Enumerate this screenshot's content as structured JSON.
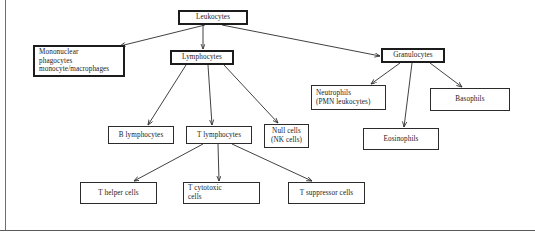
{
  "diagram": {
    "style": {
      "line_color": "#2b2b2b",
      "box_border_color": "#2b2b2b",
      "text_color": "#1a1a1a",
      "background": "#ffffff",
      "frame_color": "#5a5a5a"
    },
    "nodes": [
      {
        "id": "leukocytes",
        "label": "Leukocytes",
        "x": 178,
        "y": 10,
        "w": 70,
        "h": 15,
        "emphasis": "thick",
        "align": "center"
      },
      {
        "id": "mononuclear-phagocytes",
        "label": "Mononuclear\nphagocytes\nmonocyte/macrophages",
        "x": 33,
        "y": 45,
        "w": 92,
        "h": 32,
        "emphasis": "thick",
        "align": "left"
      },
      {
        "id": "lymphocytes",
        "label": "Lymphocytes",
        "x": 170,
        "y": 50,
        "w": 64,
        "h": 15,
        "emphasis": "thick",
        "align": "center"
      },
      {
        "id": "granulocytes",
        "label": "Granulocytes",
        "x": 381,
        "y": 48,
        "w": 64,
        "h": 15,
        "emphasis": "thick",
        "align": "center"
      },
      {
        "id": "neutrophils",
        "label": "Neutrophils\n(PMN leukocytes)",
        "x": 311,
        "y": 85,
        "w": 75,
        "h": 25,
        "emphasis": "normal",
        "align": "left"
      },
      {
        "id": "basophils",
        "label": "Basophils",
        "x": 430,
        "y": 88,
        "w": 80,
        "h": 23,
        "emphasis": "normal",
        "align": "center"
      },
      {
        "id": "eosinophils",
        "label": "Eosinophils",
        "x": 363,
        "y": 128,
        "w": 76,
        "h": 22,
        "emphasis": "normal",
        "align": "center"
      },
      {
        "id": "b-lymphocytes",
        "label": "B lymphocytes",
        "x": 108,
        "y": 126,
        "w": 66,
        "h": 18,
        "emphasis": "normal",
        "align": "center"
      },
      {
        "id": "t-lymphocytes",
        "label": "T lymphocytes",
        "x": 186,
        "y": 126,
        "w": 66,
        "h": 18,
        "emphasis": "normal",
        "align": "center"
      },
      {
        "id": "null-cells",
        "label": "Null cells\n(NK cells)",
        "x": 264,
        "y": 124,
        "w": 45,
        "h": 24,
        "emphasis": "normal",
        "align": "center"
      },
      {
        "id": "t-helper-cells",
        "label": "T helper cells",
        "x": 80,
        "y": 182,
        "w": 77,
        "h": 22,
        "emphasis": "normal",
        "align": "center"
      },
      {
        "id": "t-cytotoxic-cells",
        "label": "T cytotoxic\ncells",
        "x": 183,
        "y": 182,
        "w": 77,
        "h": 22,
        "emphasis": "normal",
        "align": "left"
      },
      {
        "id": "t-suppressor-cells",
        "label": "T suppressor cells",
        "x": 288,
        "y": 182,
        "w": 77,
        "h": 22,
        "emphasis": "normal",
        "align": "center"
      }
    ],
    "edges": [
      {
        "id": "leukocytes-to-mononuclear",
        "from": "leukocytes",
        "to": "mononuclear-phagocytes",
        "x1": 205,
        "y1": 25,
        "x2": 120,
        "y2": 46
      },
      {
        "id": "leukocytes-to-lymphocytes",
        "from": "leukocytes",
        "to": "lymphocytes",
        "x1": 203,
        "y1": 25,
        "x2": 203,
        "y2": 49
      },
      {
        "id": "leukocytes-to-granulocytes",
        "from": "leukocytes",
        "to": "granulocytes",
        "x1": 222,
        "y1": 25,
        "x2": 380,
        "y2": 56
      },
      {
        "id": "lymphocytes-to-b-lymphocytes",
        "from": "lymphocytes",
        "to": "b-lymphocytes",
        "x1": 186,
        "y1": 65,
        "x2": 148,
        "y2": 125
      },
      {
        "id": "lymphocytes-to-t-lymphocytes",
        "from": "lymphocytes",
        "to": "t-lymphocytes",
        "x1": 208,
        "y1": 65,
        "x2": 212,
        "y2": 125
      },
      {
        "id": "lymphocytes-to-null-cells",
        "from": "lymphocytes",
        "to": "null-cells",
        "x1": 224,
        "y1": 65,
        "x2": 278,
        "y2": 123
      },
      {
        "id": "granulocytes-to-neutrophils",
        "from": "granulocytes",
        "to": "neutrophils",
        "x1": 400,
        "y1": 63,
        "x2": 371,
        "y2": 84
      },
      {
        "id": "granulocytes-to-eosinophils",
        "from": "granulocytes",
        "to": "eosinophils",
        "x1": 412,
        "y1": 63,
        "x2": 404,
        "y2": 127
      },
      {
        "id": "granulocytes-to-basophils",
        "from": "granulocytes",
        "to": "basophils",
        "x1": 430,
        "y1": 63,
        "x2": 462,
        "y2": 87
      },
      {
        "id": "t-lymphocytes-to-t-helper",
        "from": "t-lymphocytes",
        "to": "t-helper-cells",
        "x1": 203,
        "y1": 144,
        "x2": 134,
        "y2": 181
      },
      {
        "id": "t-lymphocytes-to-t-cytotoxic",
        "from": "t-lymphocytes",
        "to": "t-cytotoxic-cells",
        "x1": 218,
        "y1": 144,
        "x2": 219,
        "y2": 181
      },
      {
        "id": "t-lymphocytes-to-t-suppressor",
        "from": "t-lymphocytes",
        "to": "t-suppressor-cells",
        "x1": 232,
        "y1": 144,
        "x2": 312,
        "y2": 181
      }
    ]
  }
}
